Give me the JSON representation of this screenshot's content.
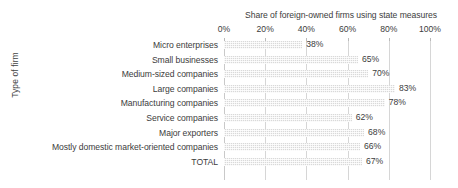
{
  "chart_data": {
    "type": "bar",
    "orientation": "horizontal",
    "title": "Share of foreign-owned firms using state measures",
    "xlabel": "",
    "ylabel": "Type of firm",
    "categories": [
      "Micro enterprises",
      "Small businesses",
      "Medium-sized companies",
      "Large companies",
      "Manufacturing companies",
      "Service companies",
      "Major exporters",
      "Mostly domestic market-oriented companies",
      "TOTAL"
    ],
    "values": [
      38,
      65,
      70,
      83,
      78,
      62,
      68,
      66,
      67
    ],
    "value_labels": [
      "38%",
      "65%",
      "70%",
      "83%",
      "78%",
      "62%",
      "68%",
      "66%",
      "67%"
    ],
    "xlim": [
      0,
      100
    ],
    "xticks": [
      0,
      20,
      40,
      60,
      80,
      100
    ],
    "xtick_labels": [
      "0%",
      "20%",
      "40%",
      "60%",
      "80%",
      "100%"
    ],
    "grid": "vertical",
    "legend": "none",
    "bar_color": "#d9d9d9",
    "gridline_color": "#d6d6d6",
    "text_color": "#3c3c3c"
  }
}
